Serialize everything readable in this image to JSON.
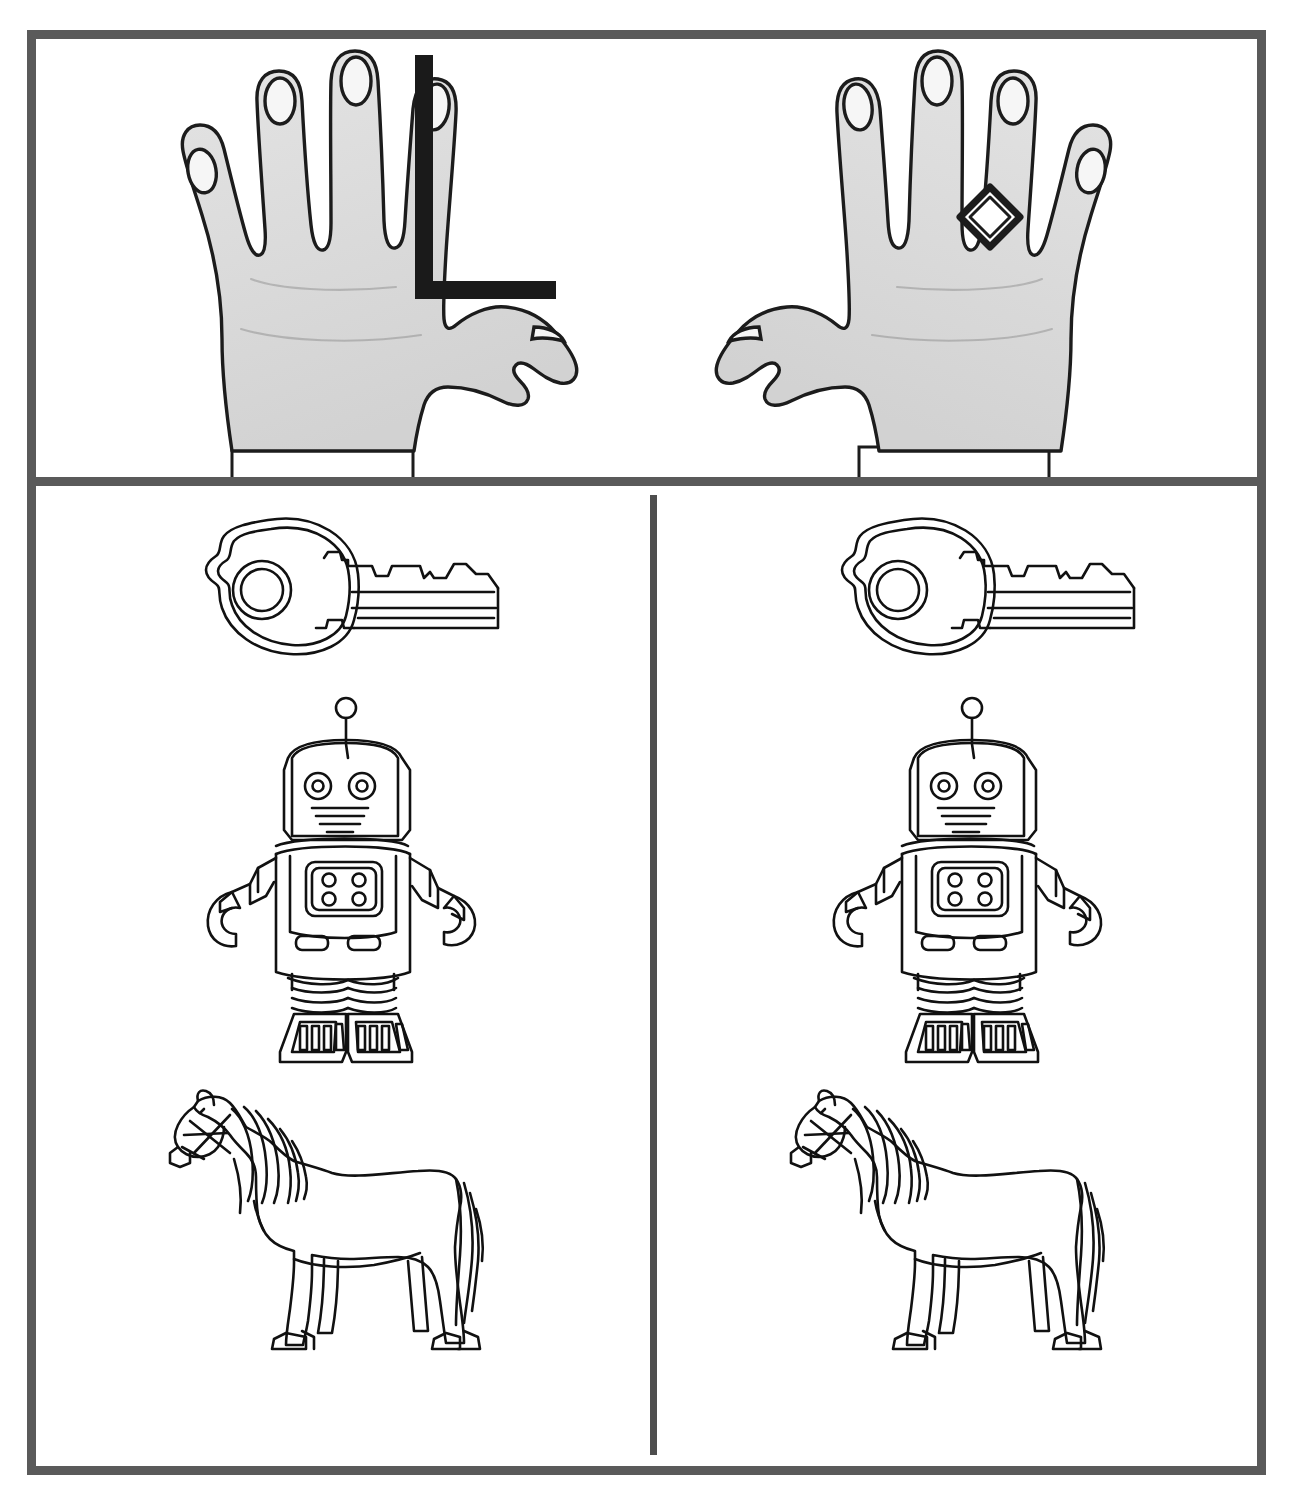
{
  "sheet": {
    "title": "Figure discrimination test sheet",
    "background_color": "#ffffff",
    "frame_color": "#5a5a5a",
    "ink_color": "#111111",
    "hand_fill_color": "#dedede",
    "occluder_color": "#1a1a1a"
  },
  "panels": {
    "top_left": {
      "name": "left-hand-panel",
      "figure_label": "hand",
      "hand_view": "back of hand, thumb to the right",
      "finger_count": "5",
      "has_cuff": "yes",
      "overlay": {
        "name": "black-L-bracket",
        "shape": "L",
        "color": "#1a1a1a"
      }
    },
    "top_right": {
      "name": "right-hand-panel",
      "figure_label": "hand",
      "hand_view": "back of hand, thumb to the left",
      "finger_count": "5",
      "has_cuff": "yes",
      "overlay": {
        "name": "diamond-ring",
        "shape": "diamond",
        "worn_on": "ring finger"
      }
    },
    "bottom_left": {
      "name": "left-object-column",
      "items": [
        {
          "label": "key",
          "icon": "key-icon"
        },
        {
          "label": "robot",
          "icon": "robot-icon"
        },
        {
          "label": "horse",
          "icon": "horse-icon"
        }
      ]
    },
    "bottom_right": {
      "name": "right-object-column",
      "items": [
        {
          "label": "key",
          "icon": "key-icon"
        },
        {
          "label": "robot",
          "icon": "robot-icon"
        },
        {
          "label": "horse",
          "icon": "horse-icon"
        }
      ]
    }
  }
}
